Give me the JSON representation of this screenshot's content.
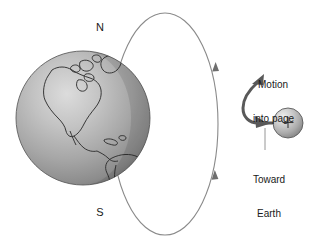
{
  "figure": {
    "name": "earth-magnetic-field-charged-particle-diagram",
    "background_color": "#ffffff",
    "width": 319,
    "height": 247
  },
  "earth": {
    "name": "earth-globe",
    "center_x": 83,
    "center_y": 118,
    "radius": 67,
    "fill_light": "#d8d8d8",
    "fill_mid": "#a9a9a9",
    "fill_dark": "#707070",
    "outline_color": "#4a4a4a",
    "continents_label": "North and South America",
    "pole_north_label": "N",
    "pole_south_label": "S"
  },
  "field_line": {
    "name": "magnetic-field-line-ellipse",
    "center_x": 165,
    "center_y": 124,
    "radius_x": 53,
    "radius_y": 111,
    "stroke_color": "#8a8a8a",
    "stroke_width": 1,
    "arrow_upper_direction": "down",
    "arrow_lower_direction": "up",
    "arrow_color": "#6e6e6e"
  },
  "particle": {
    "name": "positive-charged-particle",
    "center_x": 288,
    "center_y": 123,
    "radius": 15,
    "charge_symbol": "+",
    "fill_light": "#e2e2e2",
    "fill_mid": "#b4b4b4",
    "fill_dark": "#7a7a7a",
    "outline_color": "#5a5a5a"
  },
  "trajectory": {
    "name": "particle-trajectory-arrow",
    "stroke_color": "#595959",
    "stroke_width": 3,
    "description": "curved path leaving the particle toward Earth then deflecting up and out of the page"
  },
  "labels": {
    "motion": {
      "line1": "Motion",
      "line2": "into page"
    },
    "toward": {
      "line1": "Toward",
      "line2": "Earth"
    },
    "leader_color": "#8a8a8a"
  }
}
